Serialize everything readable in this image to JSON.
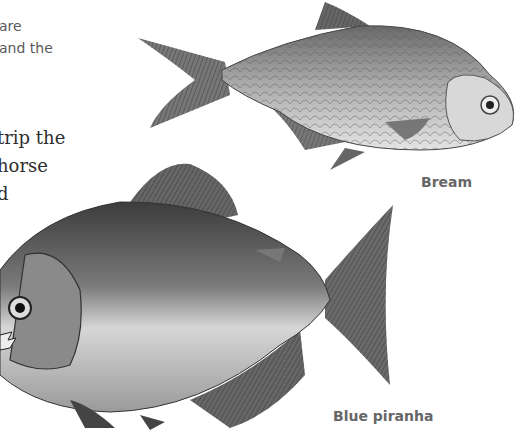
{
  "page": {
    "background": "#ffffff"
  },
  "body_text": {
    "sans_lines": [
      "are",
      "and the"
    ],
    "serif_lines": [
      "trip the",
      "horse",
      "d"
    ]
  },
  "figures": [
    {
      "name": "bream",
      "caption": "Bream",
      "icon": "bream-fish-illustration"
    },
    {
      "name": "blue-piranha",
      "caption": "Blue piranha",
      "icon": "piranha-fish-illustration"
    }
  ]
}
